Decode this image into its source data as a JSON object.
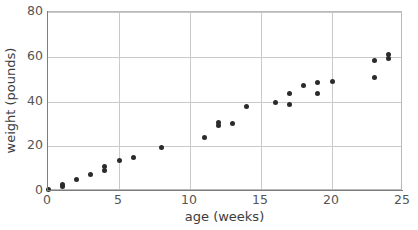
{
  "chart_data": {
    "type": "scatter",
    "title": "",
    "xlabel": "age (weeks)",
    "ylabel": "weight (pounds)",
    "xlim": [
      0,
      25
    ],
    "ylim": [
      0,
      80
    ],
    "xticks": [
      0,
      5,
      10,
      15,
      20,
      25
    ],
    "yticks": [
      0,
      20,
      40,
      60,
      80
    ],
    "grid": true,
    "legend": null,
    "marker": {
      "shape": "circle",
      "color": "#2b2b2b",
      "size": 5
    },
    "points": [
      {
        "x": 0,
        "y": 0.6
      },
      {
        "x": 1,
        "y": 2.1
      },
      {
        "x": 1,
        "y": 3.0
      },
      {
        "x": 2,
        "y": 5.3
      },
      {
        "x": 3,
        "y": 7.3
      },
      {
        "x": 4,
        "y": 9.2
      },
      {
        "x": 4,
        "y": 10.8
      },
      {
        "x": 5,
        "y": 13.5
      },
      {
        "x": 6,
        "y": 15.0
      },
      {
        "x": 8,
        "y": 19.6
      },
      {
        "x": 11,
        "y": 24.0
      },
      {
        "x": 12,
        "y": 29.4
      },
      {
        "x": 12,
        "y": 30.8
      },
      {
        "x": 13,
        "y": 30.3
      },
      {
        "x": 14,
        "y": 37.6
      },
      {
        "x": 16,
        "y": 39.5
      },
      {
        "x": 17,
        "y": 38.6
      },
      {
        "x": 17,
        "y": 43.5
      },
      {
        "x": 18,
        "y": 47.2
      },
      {
        "x": 19,
        "y": 43.6
      },
      {
        "x": 19,
        "y": 48.7
      },
      {
        "x": 20,
        "y": 49.1
      },
      {
        "x": 23,
        "y": 50.6
      },
      {
        "x": 23,
        "y": 58.5
      },
      {
        "x": 24,
        "y": 59.3
      },
      {
        "x": 24,
        "y": 61.2
      }
    ]
  },
  "colors": {
    "marker": "#2b2b2b",
    "grid": "#c9c9c9",
    "axis": "#7d7d7d",
    "frame": "#b9b9b9",
    "tick_text": "#555555",
    "title_text": "#3c3c3c",
    "background": "#ffffff"
  }
}
